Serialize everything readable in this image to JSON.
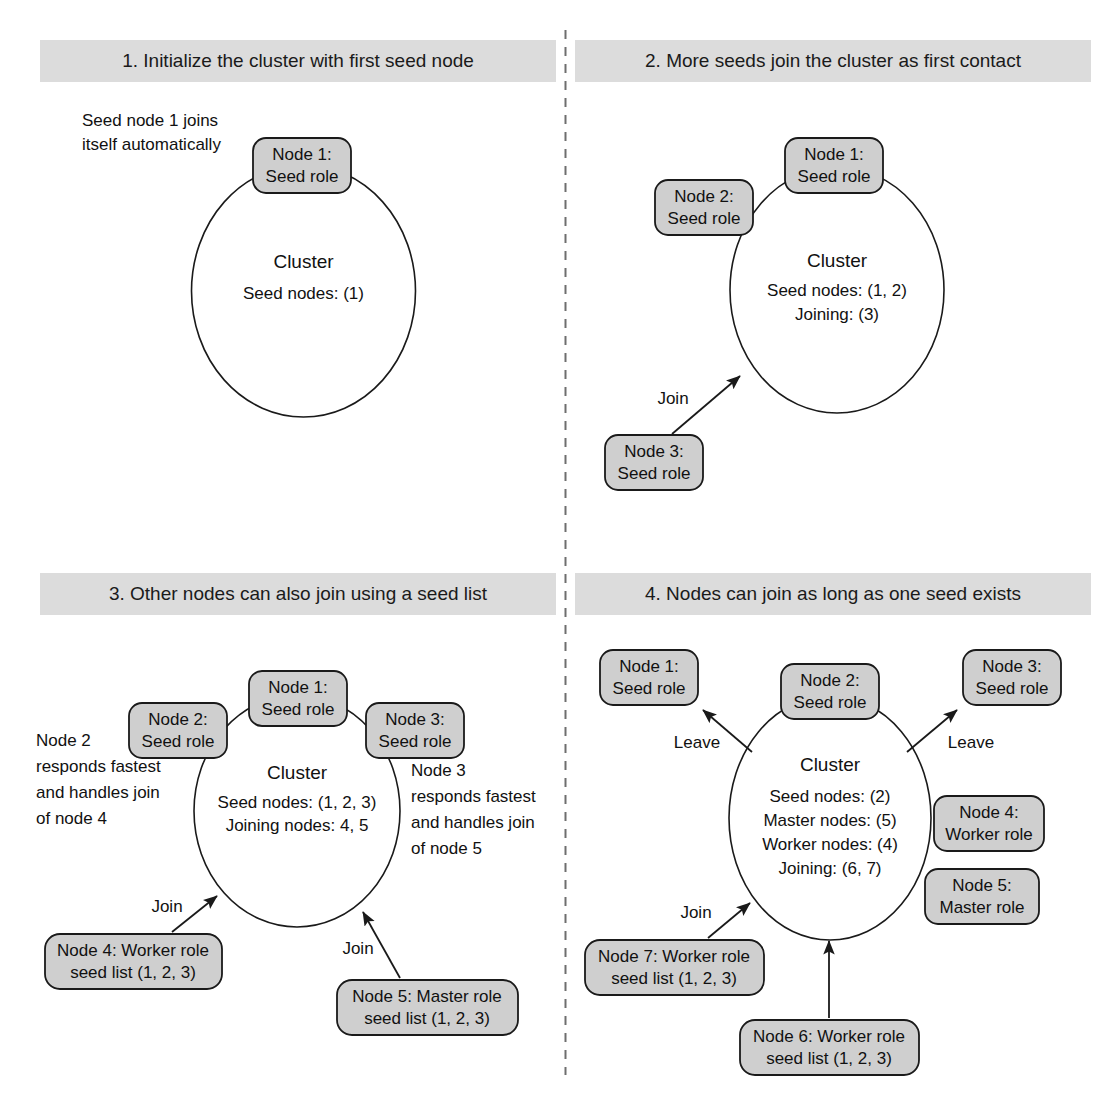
{
  "figure": {
    "type": "diagram",
    "background": "#ffffff",
    "band_color": "#dcdcdc",
    "node_fill": "#cfcfcf",
    "stroke_color": "#1a1a1a",
    "divider_color": "#6e6e6e"
  },
  "panels": [
    {
      "id": "panel-1",
      "title": "1. Initialize the cluster with first seed node",
      "annotations": [
        {
          "id": "annot-seed1",
          "lines": [
            "Seed node 1 joins",
            "itself automatically"
          ]
        }
      ],
      "cluster": {
        "label": "Cluster",
        "lines": [
          "Seed nodes: (1)"
        ]
      },
      "nodes": [
        {
          "id": "node-1",
          "lines": [
            "Node 1:",
            "Seed role"
          ]
        }
      ],
      "edges": []
    },
    {
      "id": "panel-2",
      "title": "2. More seeds join the cluster as first contact",
      "annotations": [],
      "cluster": {
        "label": "Cluster",
        "lines": [
          "Seed nodes: (1, 2)",
          "Joining: (3)"
        ]
      },
      "nodes": [
        {
          "id": "node-1",
          "lines": [
            "Node 1:",
            "Seed role"
          ]
        },
        {
          "id": "node-2",
          "lines": [
            "Node 2:",
            "Seed role"
          ]
        },
        {
          "id": "node-3",
          "lines": [
            "Node 3:",
            "Seed role"
          ]
        }
      ],
      "edges": [
        {
          "id": "edge-join-3",
          "label": "Join"
        }
      ]
    },
    {
      "id": "panel-3",
      "title": "3. Other nodes can also join using a seed list",
      "annotations": [
        {
          "id": "annot-node2",
          "lines": [
            "Node 2",
            "responds fastest",
            "and handles join",
            "of node 4"
          ]
        },
        {
          "id": "annot-node3",
          "lines": [
            "Node 3",
            "responds fastest",
            "and handles join",
            "of node 5"
          ]
        }
      ],
      "cluster": {
        "label": "Cluster",
        "lines": [
          "Seed nodes: (1, 2, 3)",
          "Joining nodes: 4, 5"
        ]
      },
      "nodes": [
        {
          "id": "node-1",
          "lines": [
            "Node 1:",
            "Seed role"
          ]
        },
        {
          "id": "node-2",
          "lines": [
            "Node 2:",
            "Seed role"
          ]
        },
        {
          "id": "node-3",
          "lines": [
            "Node 3:",
            "Seed role"
          ]
        },
        {
          "id": "node-4",
          "lines": [
            "Node 4: Worker role",
            "seed list (1, 2, 3)"
          ]
        },
        {
          "id": "node-5",
          "lines": [
            "Node 5: Master role",
            "seed list (1, 2, 3)"
          ]
        }
      ],
      "edges": [
        {
          "id": "edge-join-4",
          "label": "Join"
        },
        {
          "id": "edge-join-5",
          "label": "Join"
        }
      ]
    },
    {
      "id": "panel-4",
      "title": "4. Nodes can join as long as one seed exists",
      "annotations": [],
      "cluster": {
        "label": "Cluster",
        "lines": [
          "Seed nodes: (2)",
          "Master nodes: (5)",
          "Worker nodes: (4)",
          "Joining: (6, 7)"
        ]
      },
      "nodes": [
        {
          "id": "node-1",
          "lines": [
            "Node 1:",
            "Seed role"
          ]
        },
        {
          "id": "node-2",
          "lines": [
            "Node 2:",
            "Seed role"
          ]
        },
        {
          "id": "node-3",
          "lines": [
            "Node 3:",
            "Seed role"
          ]
        },
        {
          "id": "node-4",
          "lines": [
            "Node 4:",
            "Worker role"
          ]
        },
        {
          "id": "node-5",
          "lines": [
            "Node 5:",
            "Master role"
          ]
        },
        {
          "id": "node-6",
          "lines": [
            "Node 6: Worker role",
            "seed list (1, 2, 3)"
          ]
        },
        {
          "id": "node-7",
          "lines": [
            "Node 7: Worker role",
            "seed list (1, 2, 3)"
          ]
        }
      ],
      "edges": [
        {
          "id": "edge-leave-1",
          "label": "Leave"
        },
        {
          "id": "edge-leave-3",
          "label": "Leave"
        },
        {
          "id": "edge-join-7",
          "label": "Join"
        },
        {
          "id": "edge-join-6",
          "label": "Join"
        }
      ]
    }
  ]
}
